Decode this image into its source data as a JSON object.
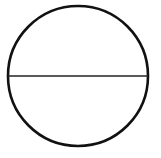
{
  "diagram": {
    "shape": "circle-with-diameter",
    "circle": {
      "cx": 78,
      "cy": 76,
      "r": 70,
      "stroke": "#111111",
      "stroke_width": 2.6
    },
    "diameter": {
      "x1": 8,
      "y1": 76,
      "x2": 148,
      "y2": 76,
      "stroke": "#222222",
      "stroke_width": 1.6
    },
    "background": "#ffffff"
  }
}
